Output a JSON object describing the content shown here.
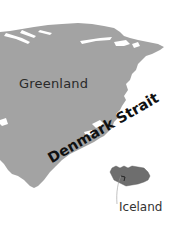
{
  "map": {
    "colors": {
      "greenland": "#a3a3a3",
      "iceland": "#6e6e6e",
      "background": "#ffffff",
      "leader_line": "#999999"
    },
    "labels": {
      "greenland": "Greenland",
      "strait": "Denmark Strait",
      "iceland": "Iceland"
    },
    "features": [
      {
        "name": "Greenland",
        "type": "landmass"
      },
      {
        "name": "Iceland",
        "type": "landmass"
      },
      {
        "name": "Denmark Strait",
        "type": "water-body"
      }
    ]
  }
}
